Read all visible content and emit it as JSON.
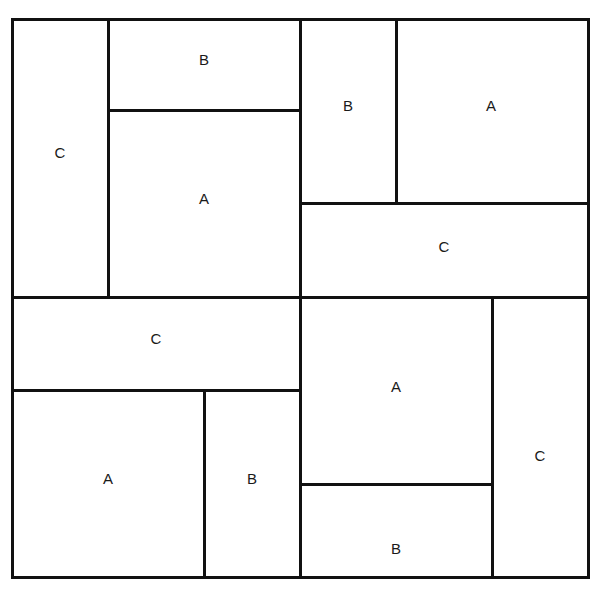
{
  "diagram": {
    "title": "",
    "frame": {
      "x": 12,
      "y": 19,
      "w": 576,
      "h": 558
    },
    "line_color": "#111111",
    "line_width": 3,
    "regions": [
      {
        "label": "C",
        "x": 12,
        "y": 19,
        "w": 96,
        "h": 278,
        "cx": 60,
        "cy": 152
      },
      {
        "label": "B",
        "x": 108,
        "y": 19,
        "w": 192,
        "h": 91,
        "cx": 204,
        "cy": 59
      },
      {
        "label": "A",
        "x": 108,
        "y": 110,
        "w": 192,
        "h": 187,
        "cx": 204,
        "cy": 198
      },
      {
        "label": "B",
        "x": 300,
        "y": 19,
        "w": 96,
        "h": 184,
        "cx": 348,
        "cy": 105
      },
      {
        "label": "A",
        "x": 396,
        "y": 19,
        "w": 192,
        "h": 184,
        "cx": 491,
        "cy": 105
      },
      {
        "label": "C",
        "x": 300,
        "y": 203,
        "w": 288,
        "h": 94,
        "cx": 444,
        "cy": 246
      },
      {
        "label": "C",
        "x": 12,
        "y": 297,
        "w": 288,
        "h": 93,
        "cx": 156,
        "cy": 338
      },
      {
        "label": "A",
        "x": 12,
        "y": 390,
        "w": 192,
        "h": 187,
        "cx": 108,
        "cy": 478
      },
      {
        "label": "B",
        "x": 204,
        "y": 390,
        "w": 96,
        "h": 187,
        "cx": 252,
        "cy": 478
      },
      {
        "label": "A",
        "x": 300,
        "y": 297,
        "w": 192,
        "h": 187,
        "cx": 396,
        "cy": 386
      },
      {
        "label": "B",
        "x": 300,
        "y": 484,
        "w": 192,
        "h": 93,
        "cx": 396,
        "cy": 548
      },
      {
        "label": "C",
        "x": 492,
        "y": 297,
        "w": 96,
        "h": 280,
        "cx": 540,
        "cy": 455
      }
    ],
    "lines": [
      {
        "name": "frame-top",
        "x1": 12,
        "y1": 19,
        "x2": 588,
        "y2": 19
      },
      {
        "name": "frame-bottom",
        "x1": 12,
        "y1": 577,
        "x2": 588,
        "y2": 577
      },
      {
        "name": "frame-left",
        "x1": 12,
        "y1": 19,
        "x2": 12,
        "y2": 577
      },
      {
        "name": "frame-right",
        "x1": 588,
        "y1": 19,
        "x2": 588,
        "y2": 577
      },
      {
        "name": "mid-vertical",
        "x1": 300,
        "y1": 19,
        "x2": 300,
        "y2": 577
      },
      {
        "name": "mid-horizontal",
        "x1": 12,
        "y1": 297,
        "x2": 588,
        "y2": 297
      },
      {
        "name": "tl-vertical",
        "x1": 108,
        "y1": 19,
        "x2": 108,
        "y2": 297
      },
      {
        "name": "tl-horizontal",
        "x1": 108,
        "y1": 110,
        "x2": 300,
        "y2": 110
      },
      {
        "name": "tr-vertical",
        "x1": 396,
        "y1": 19,
        "x2": 396,
        "y2": 203
      },
      {
        "name": "tr-horizontal",
        "x1": 300,
        "y1": 203,
        "x2": 588,
        "y2": 203
      },
      {
        "name": "bl-horizontal",
        "x1": 12,
        "y1": 390,
        "x2": 300,
        "y2": 390
      },
      {
        "name": "bl-vertical",
        "x1": 204,
        "y1": 390,
        "x2": 204,
        "y2": 577
      },
      {
        "name": "br-vertical",
        "x1": 492,
        "y1": 297,
        "x2": 492,
        "y2": 577
      },
      {
        "name": "br-horizontal",
        "x1": 300,
        "y1": 484,
        "x2": 492,
        "y2": 484
      }
    ]
  }
}
